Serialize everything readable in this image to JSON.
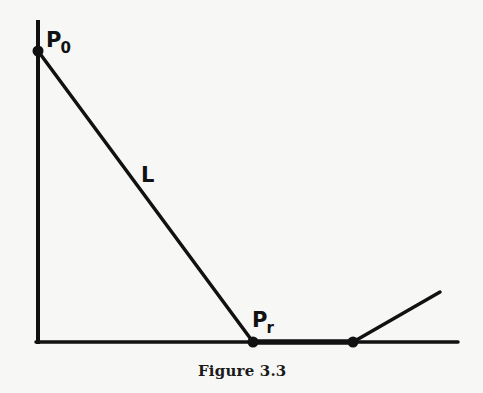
{
  "figure": {
    "caption": "Figure 3.3",
    "labels": {
      "p0": {
        "main": "P",
        "sub": "0"
      },
      "pr": {
        "main": "P",
        "sub": "r"
      },
      "line": "L"
    },
    "colors": {
      "ink": "#111111",
      "background": "#f7f7f6"
    },
    "geometry": {
      "axis_origin": [
        38,
        342
      ],
      "vertical_axis_top": [
        38,
        20
      ],
      "horizontal_axis_end": [
        458,
        342
      ],
      "p0_point": [
        38,
        51
      ],
      "pr_point": [
        253,
        342
      ],
      "second_point": [
        353,
        342
      ],
      "angled_segment_end": [
        440,
        292
      ]
    }
  }
}
